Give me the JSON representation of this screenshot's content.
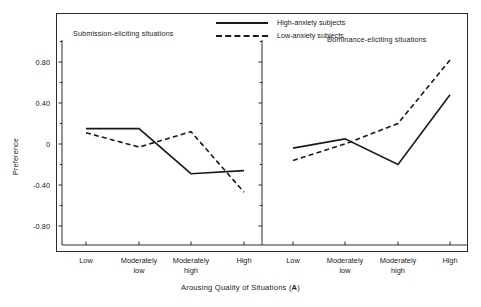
{
  "figure": {
    "y_axis_label": "Preference",
    "x_axis_title_prefix": "Arousing Quality of Situations (",
    "x_axis_title_symbol": "A",
    "x_axis_title_suffix": ")"
  },
  "legend": {
    "position": "top-center",
    "entries": [
      {
        "key": "solid",
        "label": "High-anxiety subjects"
      },
      {
        "key": "dashed",
        "label": "Low-anxiety subjects"
      }
    ]
  },
  "panels": [
    {
      "id": "left",
      "title": "Submission-eliciting situations"
    },
    {
      "id": "right",
      "title": "Dominance-eliciting situations"
    }
  ],
  "axes": {
    "y_ticks": [
      "0.80",
      "0.40",
      "0",
      "-0.40",
      "-0.80"
    ],
    "y_tick_values": [
      0.8,
      0.4,
      0,
      -0.4,
      -0.8
    ],
    "y_minor_count_between": 1,
    "x_ticks": [
      "Low",
      "Moderately\nlow",
      "Moderately\nhigh",
      "High"
    ],
    "x_tick_line1": [
      "Low",
      "Moderately",
      "Moderately",
      "High"
    ],
    "x_tick_line2": [
      "",
      "low",
      "high",
      ""
    ]
  },
  "chart_data": {
    "type": "line",
    "title": "",
    "subtitle": "",
    "xlabel": "Arousing Quality of Situations (A)",
    "ylabel": "Preference",
    "ylim": [
      -1.0,
      1.0
    ],
    "grid": false,
    "legend_position": "top-center",
    "categories": [
      "Low",
      "Moderately low",
      "Moderately high",
      "High"
    ],
    "panels": [
      {
        "name": "Submission-eliciting situations",
        "series": [
          {
            "name": "High-anxiety subjects",
            "style": "solid",
            "values": [
              0.15,
              0.15,
              -0.29,
              -0.26
            ]
          },
          {
            "name": "Low-anxiety subjects",
            "style": "dashed",
            "values": [
              0.11,
              -0.03,
              0.12,
              -0.47
            ]
          }
        ]
      },
      {
        "name": "Dominance-eliciting situations",
        "series": [
          {
            "name": "High-anxiety subjects",
            "style": "solid",
            "values": [
              -0.04,
              0.05,
              -0.2,
              0.48
            ]
          },
          {
            "name": "Low-anxiety subjects",
            "style": "dashed",
            "values": [
              -0.16,
              0.0,
              0.2,
              0.82
            ]
          }
        ]
      }
    ]
  },
  "colors": {
    "line": "#1a1a1a",
    "axis": "#2b2b2b",
    "background": "#ffffff",
    "text": "#222222"
  }
}
